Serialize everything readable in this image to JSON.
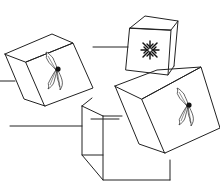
{
  "figure": {
    "description": "Line drawing of four tumbling gift boxes with leader lines",
    "colors": {
      "line": "#222222",
      "background": "#ffffff",
      "decoration": "#111111"
    },
    "boxes": [
      {
        "id": "box-left",
        "decoration": "holly-icon"
      },
      {
        "id": "box-top",
        "decoration": "snowflake-icon"
      },
      {
        "id": "box-right",
        "decoration": "holly-icon"
      },
      {
        "id": "box-center",
        "decoration": "none"
      }
    ],
    "leader_lines": 4
  }
}
